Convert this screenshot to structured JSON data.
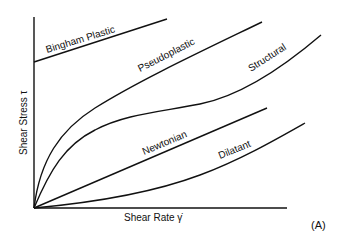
{
  "diagram": {
    "panel_label": "(A)",
    "axes": {
      "y_label": "Shear Stress τ",
      "x_label": "Shear Rate γ̇"
    },
    "curves": [
      {
        "name": "Bingham Plastic",
        "shape": "linear-with-yield"
      },
      {
        "name": "Pseudoplastic",
        "shape": "concave-down"
      },
      {
        "name": "Structural",
        "shape": "s-curve"
      },
      {
        "name": "Newtonian",
        "shape": "linear"
      },
      {
        "name": "Dilatant",
        "shape": "concave-up"
      }
    ],
    "colors": {
      "line": "#111111",
      "background": "#ffffff"
    }
  }
}
